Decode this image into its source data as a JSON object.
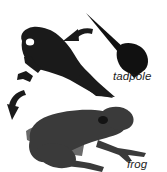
{
  "figure": {
    "title": "",
    "background_color": "#ffffff",
    "width": 167,
    "height": 172
  },
  "labels": {
    "tadpole": "tadpole",
    "frog": "frog"
  },
  "colors": {
    "background": "#ffffff",
    "froglet_body": "#1a1a1a",
    "tadpole_body": "#111111",
    "frog_body": "#3a3a3a",
    "frog_limb_light": "#6a6a6a",
    "frog_eye": "#141414",
    "froglet_eye": "#ffffff",
    "arrow": "#1a1a1a",
    "label_text": "#1c1c1c"
  },
  "stages": [
    {
      "name": "tadpole",
      "label": "tadpole",
      "description": "dark tadpole with long tapering tail pointing up-left",
      "position": "upper-right"
    },
    {
      "name": "froglet",
      "label": "",
      "description": "near-black froglet with legs and remaining tail",
      "position": "upper-left"
    },
    {
      "name": "frog",
      "label": "frog",
      "description": "dark gray adult frog facing right with splayed legs",
      "position": "bottom"
    }
  ],
  "arrows": [
    {
      "name": "tadpole-to-froglet",
      "direction": "right-to-left curving down",
      "position": "upper-middle"
    },
    {
      "name": "froglet-to-frog",
      "direction": "upper-right to lower-left curving down",
      "position": "middle-left"
    }
  ]
}
